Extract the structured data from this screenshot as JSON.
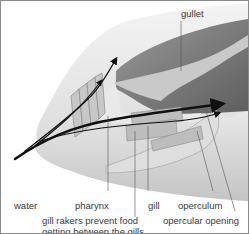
{
  "figure": {
    "labels": {
      "gullet": "gullet",
      "water": "water",
      "pharynx": "pharynx",
      "gill": "gill",
      "operculum": "operculum",
      "gill_rakers_line1": "gill rakers prevent food",
      "gill_rakers_line2": "getting between the gills",
      "opercular_opening": "opercular opening"
    },
    "colors": {
      "background": "#ffffff",
      "head_light": "#e6e6e6",
      "cavity_dark": "#7a7a7a",
      "gill_tissue": "#b5b5b5",
      "arrow": "#111111",
      "leader_line": "#555555",
      "border": "#8a8a8a"
    }
  }
}
